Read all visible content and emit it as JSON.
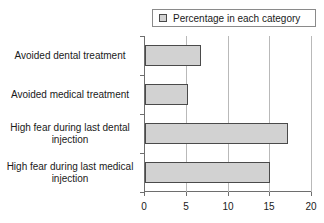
{
  "legend": {
    "swatch_name": "legend-color-swatch",
    "label": "Percentage in each category",
    "position": "top-right",
    "color": "#d2d2d2"
  },
  "axis": {
    "x_ticks": [
      "0",
      "5",
      "10",
      "15",
      "20"
    ],
    "xlabel": "",
    "ylabel": ""
  },
  "chart_data": {
    "type": "bar",
    "orientation": "horizontal",
    "title": "",
    "subtitle": "",
    "xlabel": "",
    "ylabel": "",
    "xlim": [
      0,
      20
    ],
    "xticks": [
      0,
      5,
      10,
      15,
      20
    ],
    "grid": true,
    "legend": [
      "Percentage in each category"
    ],
    "legend_position": "top-right",
    "bar_color": "#d2d2d2",
    "bar_edge_color": "#4a4a4a",
    "categories": [
      "Avoided dental treatment",
      "Avoided medical treatment",
      "High fear during last dental injection",
      "High fear during last medical injection"
    ],
    "category_lines": [
      [
        "Avoided dental treatment"
      ],
      [
        "Avoided medical treatment"
      ],
      [
        "High fear during last dental",
        "injection"
      ],
      [
        "High fear during last medical",
        "injection"
      ]
    ],
    "series": [
      {
        "name": "Percentage in each category",
        "values": [
          6.7,
          5.2,
          17.1,
          15.0
        ]
      }
    ],
    "values": [
      6.7,
      5.2,
      17.1,
      15.0
    ]
  }
}
